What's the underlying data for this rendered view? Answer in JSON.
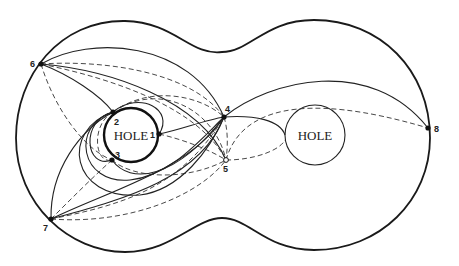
{
  "diagram": {
    "holes": [
      {
        "label": "HOLE",
        "cx": 131,
        "cy": 135,
        "r": 27,
        "style": "thick"
      },
      {
        "label": "HOLE",
        "cx": 315,
        "cy": 135,
        "r": 30,
        "style": "thin"
      }
    ],
    "points": [
      {
        "id": "1",
        "label": "1",
        "x": 159,
        "y": 134,
        "filled": true
      },
      {
        "id": "2",
        "label": "2",
        "x": 113,
        "y": 112,
        "filled": true
      },
      {
        "id": "3",
        "label": "3",
        "x": 112,
        "y": 160,
        "filled": true
      },
      {
        "id": "4",
        "label": "4",
        "x": 224,
        "y": 117,
        "filled": true
      },
      {
        "id": "5",
        "label": "5",
        "x": 226,
        "y": 160,
        "filled": false
      },
      {
        "id": "6",
        "label": "6",
        "x": 41,
        "y": 64,
        "filled": true
      },
      {
        "id": "7",
        "label": "7",
        "x": 51,
        "y": 219,
        "filled": true
      },
      {
        "id": "8",
        "label": "8",
        "x": 428,
        "y": 128,
        "filled": true
      }
    ],
    "legend": {
      "solid": "solid curve",
      "dashed": "dashed curve"
    }
  }
}
